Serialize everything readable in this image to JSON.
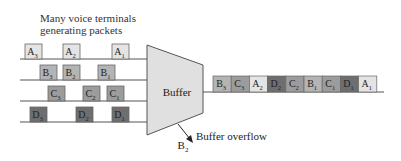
{
  "diagram": {
    "caption_line1": "Many voice terminals",
    "caption_line2": "generating packets",
    "buffer_label": "Buffer",
    "overflow_label": "Buffer overflow",
    "dropped_packet": {
      "letter": "B",
      "sub": "2"
    },
    "colors": {
      "A": "#e4e4e4",
      "B": "#b4b4b4",
      "C": "#9c9c9c",
      "D": "#6e6e6e",
      "buffer_fill": "#e0e0e0",
      "line": "#555555"
    },
    "input_lines": [
      {
        "name": "A",
        "packets": [
          {
            "letter": "A",
            "sub": "3",
            "x": 25
          },
          {
            "letter": "A",
            "sub": "2",
            "x": 63
          },
          {
            "letter": "A",
            "sub": "1",
            "x": 112
          }
        ]
      },
      {
        "name": "B",
        "packets": [
          {
            "letter": "B",
            "sub": "3",
            "x": 40
          },
          {
            "letter": "B",
            "sub": "2",
            "x": 63
          },
          {
            "letter": "B",
            "sub": "1",
            "x": 98
          }
        ]
      },
      {
        "name": "C",
        "packets": [
          {
            "letter": "C",
            "sub": "3",
            "x": 48
          },
          {
            "letter": "C",
            "sub": "2",
            "x": 83
          },
          {
            "letter": "C",
            "sub": "1",
            "x": 107
          }
        ]
      },
      {
        "name": "D",
        "packets": [
          {
            "letter": "D",
            "sub": "3",
            "x": 30
          },
          {
            "letter": "D",
            "sub": "2",
            "x": 76
          },
          {
            "letter": "D",
            "sub": "1",
            "x": 112
          }
        ]
      }
    ],
    "output_queue": [
      {
        "letter": "B",
        "sub": "3"
      },
      {
        "letter": "C",
        "sub": "3"
      },
      {
        "letter": "A",
        "sub": "2"
      },
      {
        "letter": "D",
        "sub": "2"
      },
      {
        "letter": "C",
        "sub": "2"
      },
      {
        "letter": "B",
        "sub": "1"
      },
      {
        "letter": "C",
        "sub": "1"
      },
      {
        "letter": "D",
        "sub": "1"
      },
      {
        "letter": "A",
        "sub": "1"
      }
    ]
  }
}
